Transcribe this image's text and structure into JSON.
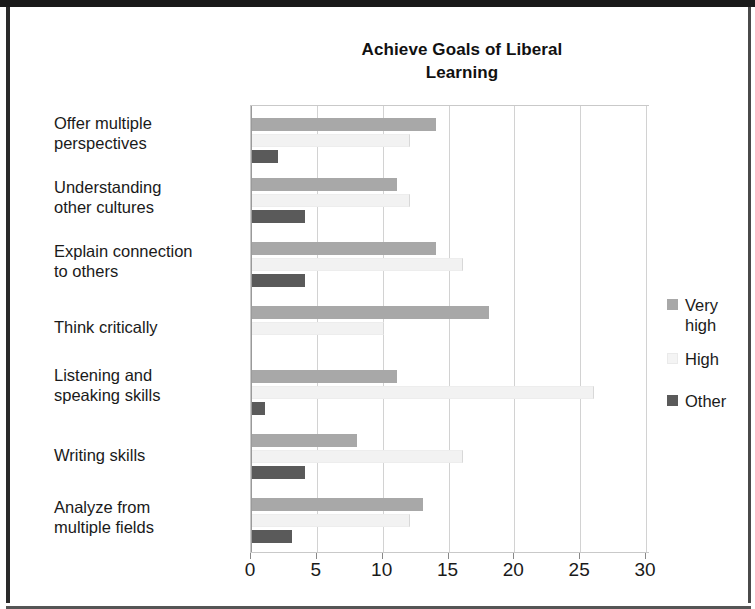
{
  "figure": {
    "title": "Achieve Goals of Liberal\nLearning",
    "title_line1": "Achieve Goals of Liberal",
    "title_line2": "Learning"
  },
  "axis": {
    "ticks": [
      "0",
      "5",
      "10",
      "15",
      "20",
      "25",
      "30"
    ]
  },
  "legend": {
    "items": [
      {
        "label": "Very\nhigh",
        "color": "#a8a8a8"
      },
      {
        "label": "High",
        "color": "#f4f4f4"
      },
      {
        "label": "Other",
        "color": "#5a5a5a"
      }
    ]
  },
  "categories": [
    {
      "label": "Offer multiple\nperspectives"
    },
    {
      "label": "Understanding\nother cultures"
    },
    {
      "label": "Explain connection\nto others"
    },
    {
      "label": "Think critically"
    },
    {
      "label": "Listening and\nspeaking skills"
    },
    {
      "label": "Writing skills"
    },
    {
      "label": "Analyze from\nmultiple fields"
    }
  ],
  "chart_data": {
    "type": "bar",
    "orientation": "horizontal",
    "title": "Achieve Goals of Liberal Learning",
    "xlabel": "",
    "ylabel": "",
    "xlim": [
      0,
      30
    ],
    "xticks": [
      0,
      5,
      10,
      15,
      20,
      25,
      30
    ],
    "grid": true,
    "legend_position": "right",
    "categories": [
      "Offer multiple perspectives",
      "Understanding other cultures",
      "Explain connection to others",
      "Think critically",
      "Listening and speaking skills",
      "Writing skills",
      "Analyze from multiple fields"
    ],
    "series": [
      {
        "name": "Very high",
        "color": "#a8a8a8",
        "values": [
          14,
          11,
          14,
          18,
          11,
          8,
          13
        ]
      },
      {
        "name": "High",
        "color": "#f4f4f4",
        "values": [
          12,
          12,
          16,
          10,
          26,
          16,
          12
        ]
      },
      {
        "name": "Other",
        "color": "#5a5a5a",
        "values": [
          2,
          4,
          4,
          0,
          1,
          4,
          3
        ]
      }
    ]
  }
}
